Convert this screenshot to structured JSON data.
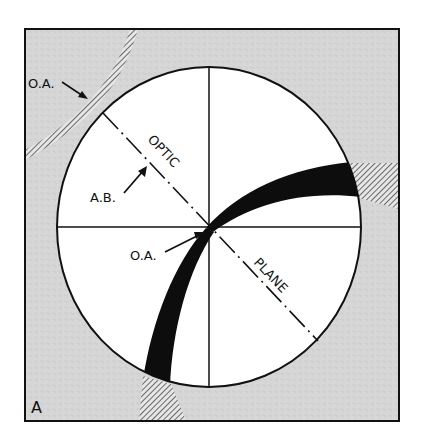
{
  "figure": {
    "panel_label": "A",
    "labels": {
      "oa_outer": "O.A.",
      "oa_center": "O.A.",
      "ab": "A.B.",
      "optic": "OPTIC",
      "plane": "PLANE"
    },
    "colors": {
      "frame_fill": "#d9d9d9",
      "circle_fill": "#ffffff",
      "ink": "#111111",
      "band": "#0d0d0d"
    }
  }
}
